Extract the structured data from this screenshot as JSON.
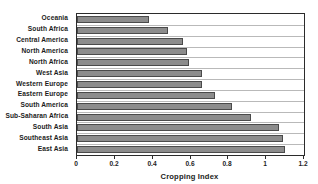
{
  "chart_data": {
    "type": "bar",
    "orientation": "horizontal",
    "title": "",
    "xlabel": "Cropping Index",
    "ylabel": "",
    "xlim": [
      0,
      1.2
    ],
    "xticks": [
      "0",
      "0.2",
      "0.4",
      "0.6",
      "0.8",
      "1",
      "1.2"
    ],
    "xtick_values": [
      0,
      0.2,
      0.4,
      0.6,
      0.8,
      1.0,
      1.2
    ],
    "grid": false,
    "legend": "none",
    "bar_color": "#8c8c8c",
    "bar_edge_color": "#4a4a4a",
    "axis_color": "#2b2b2b",
    "categories": [
      "Oceania",
      "South Africa",
      "Central America",
      "North America",
      "North Africa",
      "West Asia",
      "Western Europe",
      "Eastern Europe",
      "South America",
      "Sub-Saharan Africa",
      "South Asia",
      "Southeast Asia",
      "East Asia"
    ],
    "values": [
      0.38,
      0.48,
      0.56,
      0.58,
      0.59,
      0.66,
      0.66,
      0.73,
      0.82,
      0.92,
      1.07,
      1.09,
      1.1
    ]
  }
}
